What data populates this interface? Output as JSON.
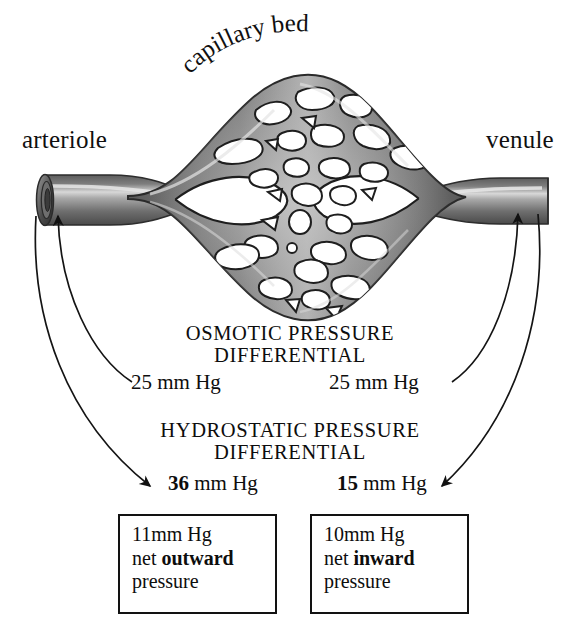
{
  "figure": {
    "title_label": "capillary bed",
    "left_vessel_label": "arteriole",
    "right_vessel_label": "venule"
  },
  "osmotic": {
    "heading_line1": "OSMOTIC PRESSURE",
    "heading_line2": "DIFFERENTIAL",
    "left_value": "25",
    "left_unit": "mm Hg",
    "right_value": "25",
    "right_unit": "mm Hg"
  },
  "hydrostatic": {
    "heading_line1": "HYDROSTATIC PRESSURE",
    "heading_line2": "DIFFERENTIAL",
    "left_value": "36",
    "left_unit": "mm Hg",
    "right_value": "15",
    "right_unit": "mm Hg"
  },
  "net_boxes": {
    "left": {
      "line1": "11mm Hg",
      "line2_pre": "net ",
      "line2_bold": "outward",
      "line3": "pressure"
    },
    "right": {
      "line1": "10mm Hg",
      "line2_pre": "net ",
      "line2_bold": "inward",
      "line3": "pressure"
    }
  },
  "colors": {
    "ink": "#111111",
    "vessel_dark": "#4f4f4f",
    "vessel_mid": "#8a8a8a",
    "vessel_light": "#c9c9c9",
    "background": "#ffffff"
  }
}
